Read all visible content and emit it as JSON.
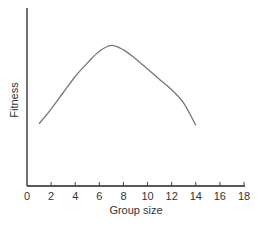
{
  "chart_data": {
    "type": "line",
    "title": "",
    "xlabel": "Group size",
    "ylabel": "Fitness",
    "xlim": [
      0,
      18
    ],
    "ylim": null,
    "x_ticks": [
      0,
      2,
      4,
      6,
      8,
      10,
      12,
      14,
      16,
      18
    ],
    "y_ticks": [],
    "grid": false,
    "legend": null,
    "series": [
      {
        "name": "Fitness",
        "x": [
          1,
          2,
          3,
          4,
          5,
          6,
          7,
          8,
          9,
          10,
          11,
          12,
          13,
          14
        ],
        "values": [
          0.42,
          0.52,
          0.63,
          0.74,
          0.83,
          0.91,
          0.95,
          0.92,
          0.86,
          0.79,
          0.72,
          0.65,
          0.56,
          0.41
        ]
      }
    ],
    "annotations": []
  },
  "labels": {
    "x_axis": "Group size",
    "y_axis": "Fitness",
    "x_ticks": [
      "0",
      "2",
      "4",
      "6",
      "8",
      "10",
      "12",
      "14",
      "16",
      "18"
    ]
  }
}
